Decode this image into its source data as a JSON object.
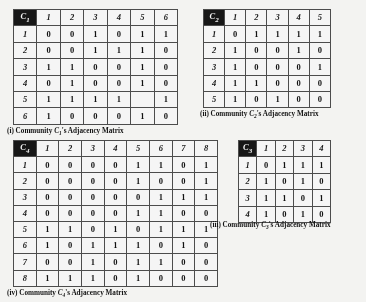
{
  "figure": {
    "kind": "adjacency-matrix-figure",
    "panel_count": 4
  },
  "panels": [
    {
      "id": "c1",
      "corner_label": "C1",
      "corner_label_base": "C",
      "corner_label_sub": "1",
      "order": 6,
      "col_headers": [
        "1",
        "2",
        "3",
        "4",
        "5",
        "6"
      ],
      "row_headers": [
        "1",
        "2",
        "3",
        "4",
        "5",
        "6"
      ],
      "rows": [
        [
          "0",
          "0",
          "1",
          "0",
          "1",
          "1"
        ],
        [
          "0",
          "0",
          "1",
          "1",
          "1",
          "0"
        ],
        [
          "1",
          "1",
          "0",
          "0",
          "1",
          "0"
        ],
        [
          "0",
          "1",
          "0",
          "0",
          "1",
          "0"
        ],
        [
          "1",
          "1",
          "1",
          "1",
          "",
          "1"
        ],
        [
          "1",
          "0",
          "0",
          "0",
          "1",
          "0"
        ]
      ],
      "caption_index": "(i)",
      "caption_prefix": "Community",
      "caption_symbol": "C",
      "caption_symbol_sub": "1",
      "caption_suffix": "'s Adjacency Matrix",
      "caption_full": "(i) Community C1's Adjacency Matrix"
    },
    {
      "id": "c2",
      "corner_label": "C2",
      "corner_label_base": "C",
      "corner_label_sub": "2",
      "order": 5,
      "col_headers": [
        "1",
        "2",
        "3",
        "4",
        "5"
      ],
      "row_headers": [
        "1",
        "2",
        "3",
        "4",
        "5"
      ],
      "rows": [
        [
          "0",
          "1",
          "1",
          "1",
          "1"
        ],
        [
          "1",
          "0",
          "0",
          "1",
          "0"
        ],
        [
          "1",
          "0",
          "0",
          "0",
          "1"
        ],
        [
          "1",
          "1",
          "0",
          "0",
          "0"
        ],
        [
          "1",
          "0",
          "1",
          "0",
          "0"
        ]
      ],
      "caption_index": "(ii)",
      "caption_prefix": "Community",
      "caption_symbol": "C",
      "caption_symbol_sub": "2",
      "caption_suffix": "'s Adjacency Matrix",
      "caption_full": "(ii) Community C2's Adjacency Matrix"
    },
    {
      "id": "c3",
      "corner_label": "C3",
      "corner_label_base": "C",
      "corner_label_sub": "3",
      "order": 4,
      "col_headers": [
        "1",
        "2",
        "3",
        "4"
      ],
      "row_headers": [
        "1",
        "2",
        "3",
        "4"
      ],
      "rows": [
        [
          "0",
          "1",
          "1",
          "1"
        ],
        [
          "1",
          "0",
          "1",
          "0"
        ],
        [
          "1",
          "1",
          "0",
          "1"
        ],
        [
          "1",
          "0",
          "1",
          "0"
        ]
      ],
      "caption_index": "(iii)",
      "caption_prefix": "Community",
      "caption_symbol": "C",
      "caption_symbol_sub": "3",
      "caption_suffix": "'s Adjacency Matrix",
      "caption_full": "(iii) Community C3's Adjacency Matrix"
    },
    {
      "id": "c4",
      "corner_label": "C4",
      "corner_label_base": "C",
      "corner_label_sub": "4",
      "order": 8,
      "col_headers": [
        "1",
        "2",
        "3",
        "4",
        "5",
        "6",
        "7",
        "8"
      ],
      "row_headers": [
        "1",
        "2",
        "3",
        "4",
        "5",
        "6",
        "7",
        "8"
      ],
      "rows": [
        [
          "0",
          "0",
          "0",
          "0",
          "1",
          "1",
          "0",
          "1"
        ],
        [
          "0",
          "0",
          "0",
          "0",
          "1",
          "0",
          "0",
          "1"
        ],
        [
          "0",
          "0",
          "0",
          "0",
          "0",
          "1",
          "1",
          "1"
        ],
        [
          "0",
          "0",
          "0",
          "0",
          "1",
          "1",
          "0",
          "0"
        ],
        [
          "1",
          "1",
          "0",
          "1",
          "0",
          "1",
          "1",
          "1"
        ],
        [
          "1",
          "0",
          "1",
          "1",
          "1",
          "0",
          "1",
          "0"
        ],
        [
          "0",
          "0",
          "1",
          "0",
          "1",
          "1",
          "0",
          "0"
        ],
        [
          "1",
          "1",
          "1",
          "0",
          "1",
          "0",
          "0",
          "0"
        ]
      ],
      "caption_index": "(iv)",
      "caption_prefix": "Community",
      "caption_symbol": "C",
      "caption_symbol_sub": "4",
      "caption_suffix": "'s Adjacency Matrix",
      "caption_full": "(iv) Community C4's Adjacency Matrix"
    }
  ],
  "colors": {
    "corner_background": "#111111",
    "corner_text": "#ffffff",
    "grid_line": "#4a4a4a",
    "page_background": "#fdfdfb",
    "text": "#0b0b0b"
  }
}
